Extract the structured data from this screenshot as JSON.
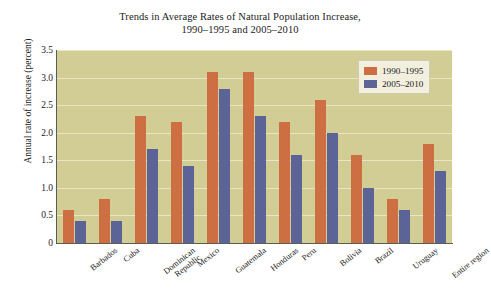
{
  "chart_data": {
    "type": "bar",
    "title": "Trends in Average Rates of Natural Population Increase, 1990–1995 and 2005–2010",
    "title_line1": "Trends in Average Rates of Natural Population Increase,",
    "title_line2": "1990–1995 and 2005–2010",
    "xlabel": "",
    "ylabel": "Annual rate of increase (percent)",
    "ylim": [
      0,
      3.5
    ],
    "ytick_labels": [
      "3.5",
      "3.0",
      "2.5",
      "2.0",
      "1.5",
      "1.0",
      "0.5",
      "0"
    ],
    "ytick_values": [
      3.5,
      3.0,
      2.5,
      2.0,
      1.5,
      1.0,
      0.5,
      0
    ],
    "grid": true,
    "grid_axis": "y",
    "legend_position": "upper right",
    "categories": [
      "Barbados",
      "Dominican Republic",
      "Cuba",
      "Mexico",
      "Guatemala",
      "Honduras",
      "Peru",
      "Bolivia",
      "Brazil",
      "Uruguay",
      "Entire region"
    ],
    "categories_ordered": [
      "Barbados",
      "Cuba",
      "Dominican Republic",
      "Mexico",
      "Guatemala",
      "Honduras",
      "Peru",
      "Bolivia",
      "Brazil",
      "Uruguay",
      "Entire region"
    ],
    "series": [
      {
        "name": "1990–1995",
        "color": "#cd6f42",
        "values": [
          0.6,
          0.8,
          2.3,
          2.2,
          3.1,
          3.1,
          2.2,
          2.6,
          1.6,
          0.8,
          1.8
        ]
      },
      {
        "name": "2005–2010",
        "color": "#5c6497",
        "values": [
          0.4,
          0.4,
          1.7,
          1.4,
          2.8,
          2.3,
          1.6,
          2.0,
          1.0,
          0.6,
          1.3
        ]
      }
    ]
  },
  "colors": {
    "plot_background": "#d2cc95",
    "gridline": "#eae6c4",
    "axis": "#5c5c50",
    "series_1990_1995": "#cd6f42",
    "series_2005_2010": "#5c6497",
    "legend_background": "#f2efdf",
    "page_background": "#ffffff",
    "text": "#1b1b1b"
  }
}
